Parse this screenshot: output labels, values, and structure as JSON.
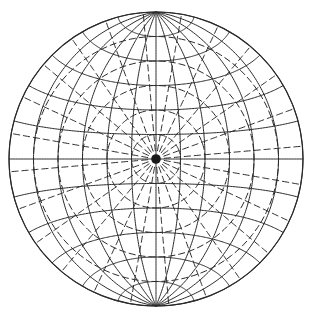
{
  "diagram": {
    "type": "globe-graticule-overlay",
    "canvas": {
      "width": 309,
      "height": 318
    },
    "center": {
      "x": 156,
      "y": 159
    },
    "radius": 147,
    "colors": {
      "line": "#2a2a2a",
      "background": "#ffffff"
    },
    "primary_graticule": {
      "style": "solid",
      "aspect": "equatorial",
      "meridian_step_deg": 15,
      "parallel_step_deg": 15,
      "poles": [
        {
          "name": "north-pole",
          "x": 155,
          "y": 12
        },
        {
          "name": "south-pole",
          "x": 155,
          "y": 306
        }
      ]
    },
    "secondary_graticule": {
      "style": "dashed",
      "aspect": "polar",
      "pole_at_center": true,
      "meridian_step_deg": 15,
      "parallel_step_deg": 15,
      "center_hub_radius": 8
    }
  }
}
